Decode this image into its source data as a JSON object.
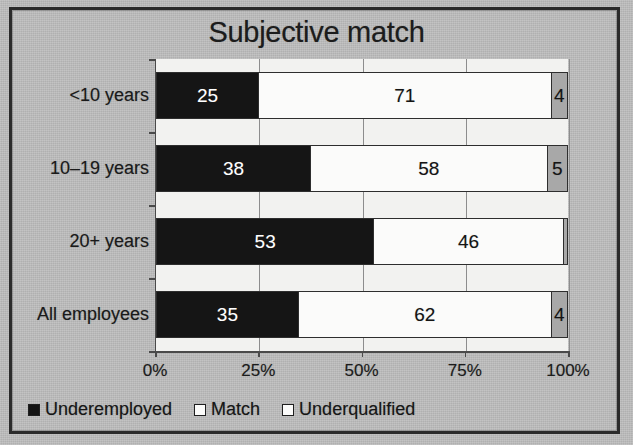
{
  "frame": {
    "background_color": "#bcbcbc",
    "border_color": "#2b2b2b"
  },
  "chart_data": {
    "type": "bar",
    "orientation": "horizontal",
    "stacked": true,
    "title": "Subjective match",
    "xlabel": "",
    "ylabel": "",
    "xlim": [
      0,
      100
    ],
    "grid": true,
    "legend_position": "bottom-left",
    "categories": [
      "<10 years",
      "10–19 years",
      "20+ years",
      "All employees"
    ],
    "tick_labels": [
      "0%",
      "25%",
      "50%",
      "75%",
      "100%"
    ],
    "tick_values": [
      0,
      25,
      50,
      75,
      100
    ],
    "series": [
      {
        "name": "Underemployed",
        "color": "#151515",
        "values": [
          25,
          38,
          53,
          35
        ],
        "labels": [
          "25",
          "38",
          "53",
          "35"
        ]
      },
      {
        "name": "Match",
        "color": "#fbfbfa",
        "values": [
          71,
          58,
          46,
          62
        ],
        "labels": [
          "71",
          "58",
          "46",
          "62"
        ]
      },
      {
        "name": "Underqualified",
        "color": "#a8a8a8",
        "values": [
          4,
          5,
          1,
          4
        ],
        "labels": [
          "4",
          "5",
          "",
          "4"
        ]
      }
    ]
  },
  "legend": {
    "items": [
      {
        "label": "Underemployed",
        "swatch": "dark"
      },
      {
        "label": "Match",
        "swatch": "light"
      },
      {
        "label": "Underqualified",
        "swatch": "gray"
      }
    ]
  }
}
